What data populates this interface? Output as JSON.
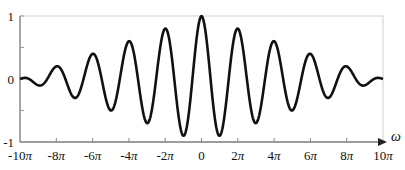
{
  "chart_data": {
    "type": "line",
    "title": "",
    "xlabel": "ω",
    "ylabel": "",
    "xlim": [
      -31.4159,
      31.4159
    ],
    "ylim": [
      -1,
      1
    ],
    "grid": false,
    "legend": null,
    "function": "y = (1 - |ω|/(10π)) · cos(ω)",
    "x_ticks": [
      {
        "value_pi": -10,
        "label": "-10π"
      },
      {
        "value_pi": -8,
        "label": "-8π"
      },
      {
        "value_pi": -6,
        "label": "-6π"
      },
      {
        "value_pi": -4,
        "label": "-4π"
      },
      {
        "value_pi": -2,
        "label": "-2π"
      },
      {
        "value_pi": 0,
        "label": "0"
      },
      {
        "value_pi": 2,
        "label": "2π"
      },
      {
        "value_pi": 4,
        "label": "4π"
      },
      {
        "value_pi": 6,
        "label": "6π"
      },
      {
        "value_pi": 8,
        "label": "8π"
      },
      {
        "value_pi": 10,
        "label": "10π"
      }
    ],
    "y_ticks": [
      {
        "value": 1,
        "label": "1"
      },
      {
        "value": 0.5,
        "label": ""
      },
      {
        "value": 0,
        "label": "0"
      },
      {
        "value": -0.5,
        "label": ""
      },
      {
        "value": -1,
        "label": "-1"
      }
    ],
    "series": [
      {
        "name": "signal",
        "color": "#111111",
        "x_pi": [
          -10,
          -9,
          -8,
          -7,
          -6,
          -5,
          -4,
          -3,
          -2,
          -1,
          0,
          1,
          2,
          3,
          4,
          5,
          6,
          7,
          8,
          9,
          10
        ],
        "values": [
          0.0,
          -0.1,
          0.2,
          -0.3,
          0.4,
          -0.5,
          0.6,
          -0.7,
          0.8,
          -0.9,
          1.0,
          -0.9,
          0.8,
          -0.7,
          0.6,
          -0.5,
          0.4,
          -0.3,
          0.2,
          -0.1,
          0.0
        ]
      }
    ]
  },
  "style": {
    "curve_color": "#111111",
    "axis_color": "#555555",
    "frame_color": "#cccccc"
  }
}
